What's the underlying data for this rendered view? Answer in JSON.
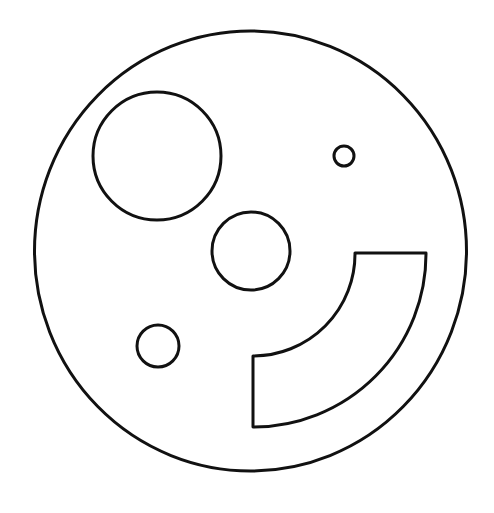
{
  "diagram": {
    "width": 494,
    "height": 513,
    "background": "#ffffff",
    "stroke_color": "#111111",
    "stroke_width": 3,
    "shapes": {
      "outer_circle": {
        "type": "ellipse",
        "cx": 250.5,
        "cy": 251,
        "rx": 216,
        "ry": 220
      },
      "large_circle": {
        "type": "circle",
        "cx": 157,
        "cy": 156,
        "r": 64
      },
      "medium_circle": {
        "type": "circle",
        "cx": 251,
        "cy": 251,
        "r": 39
      },
      "small_circle": {
        "type": "circle",
        "cx": 158,
        "cy": 346,
        "r": 21
      },
      "tiny_circle": {
        "type": "circle",
        "cx": 344,
        "cy": 156,
        "r": 10
      },
      "quarter_annulus": {
        "type": "path",
        "d": "M 355 253 L 426 253 A 173 173 0 0 1 253 427 L 253 356 A 102 102 0 0 0 355 253 Z"
      }
    }
  }
}
